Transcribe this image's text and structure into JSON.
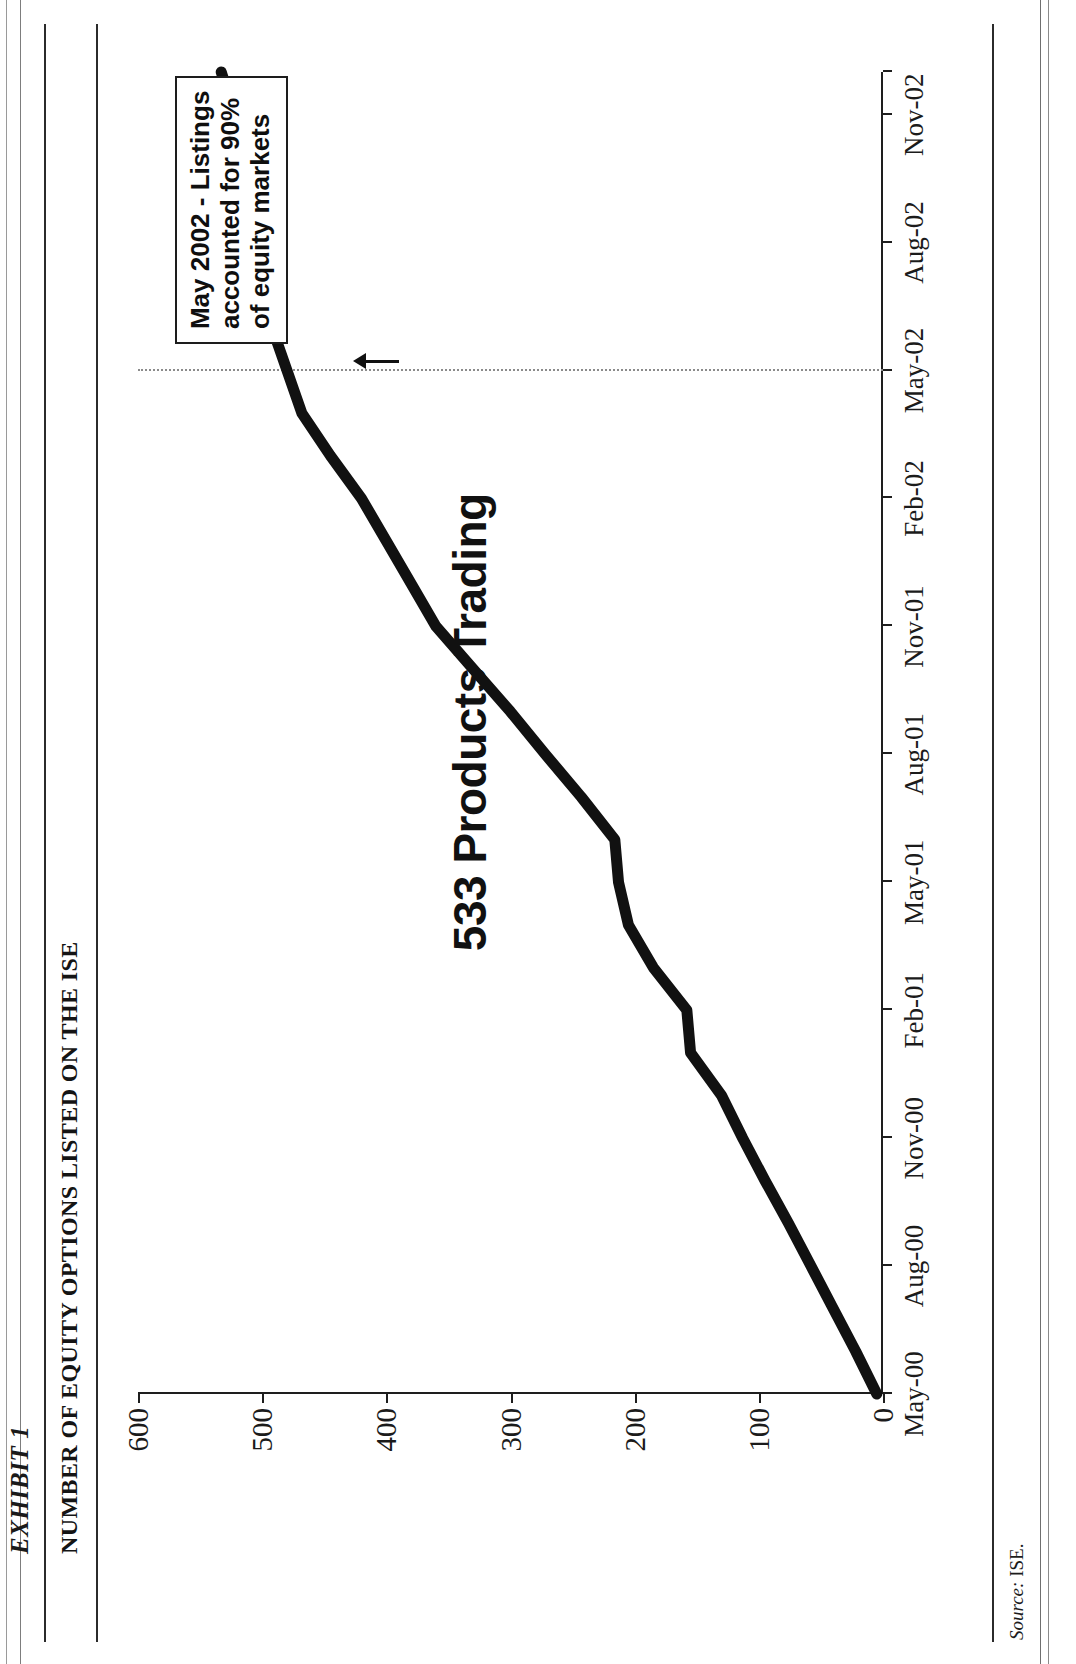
{
  "document": {
    "exhibit_label": "EXHIBIT 1",
    "exhibit_title": "NUMBER OF EQUITY OPTIONS LISTED ON THE ISE",
    "source_prefix": "Source:",
    "source_value": "ISE."
  },
  "annotation": {
    "line1": "May 2002 - Listings",
    "line2": "accounted for 90%",
    "line3": "of equity markets",
    "marker_color": "#8b8b8b",
    "box_border_color": "#1d1d1d"
  },
  "chart_data": {
    "type": "line",
    "title": "NUMBER OF EQUITY OPTIONS LISTED ON THE ISE",
    "xlabel": "",
    "ylabel": "",
    "grid": false,
    "legend": "none",
    "line_color": "#111111",
    "line_width_px": 11,
    "series_annotation": "533 Products Trading",
    "ylim": [
      0,
      600
    ],
    "yticks": [
      0,
      100,
      200,
      300,
      400,
      500,
      600
    ],
    "ytick_labels": [
      "0",
      "100",
      "200",
      "300",
      "400",
      "500",
      "600"
    ],
    "xtick_labels": [
      "May-00",
      "Aug-00",
      "Nov-00",
      "Feb-01",
      "May-01",
      "Aug-01",
      "Nov-01",
      "Feb-02",
      "May-02",
      "Aug-02",
      "Nov-02"
    ],
    "series": [
      {
        "name": "Equity options listed on the ISE",
        "x": [
          "May-00",
          "Jun-00",
          "Jul-00",
          "Aug-00",
          "Sep-00",
          "Oct-00",
          "Nov-00",
          "Dec-00",
          "Jan-01",
          "Feb-01",
          "Mar-01",
          "Apr-01",
          "May-01",
          "Jun-01",
          "Jul-01",
          "Aug-01",
          "Sep-01",
          "Oct-01",
          "Nov-01",
          "Dec-01",
          "Jan-02",
          "Feb-02",
          "Mar-02",
          "Apr-02",
          "May-02",
          "Jun-02",
          "Jul-02",
          "Aug-02",
          "Sep-02",
          "Oct-02",
          "Nov-02",
          "Dec-02"
        ],
        "values": [
          5,
          22,
          40,
          58,
          76,
          95,
          113,
          130,
          155,
          158,
          185,
          205,
          213,
          216,
          243,
          272,
          300,
          330,
          360,
          380,
          400,
          420,
          445,
          468,
          480,
          492,
          503,
          508,
          510,
          515,
          522,
          533
        ]
      }
    ],
    "final_value": 533,
    "annotation_point": {
      "x": "May-02",
      "value": 480,
      "note": "May 2002 - Listings accounted for 90% of equity markets"
    }
  }
}
